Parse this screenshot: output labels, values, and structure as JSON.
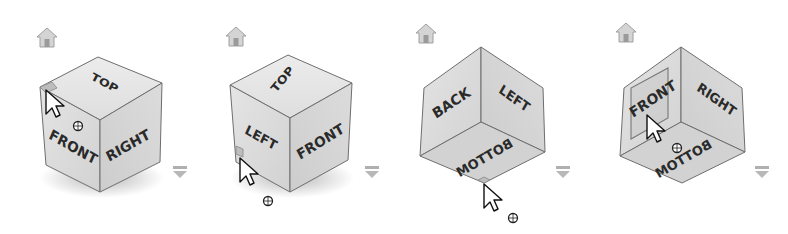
{
  "panels": [
    {
      "id": "viewcube-1",
      "faces": {
        "top": "TOP",
        "front": "FRONT",
        "right": "RIGHT"
      },
      "highlighted": "top-front-left-corner",
      "home_icon": "home-icon",
      "menu_icon": "chevron-down-icon"
    },
    {
      "id": "viewcube-2",
      "faces": {
        "top": "TOP",
        "left": "LEFT",
        "front": "FRONT"
      },
      "highlighted": "bottom-left-corner",
      "home_icon": "home-icon",
      "menu_icon": "chevron-down-icon"
    },
    {
      "id": "viewcube-3",
      "faces": {
        "back": "BACK",
        "left": "LEFT",
        "bottom": "BOTTOM"
      },
      "highlighted": "bottom-corner",
      "home_icon": "home-icon",
      "menu_icon": "chevron-down-icon"
    },
    {
      "id": "viewcube-4",
      "faces": {
        "front": "FRONT",
        "right": "RIGHT",
        "bottom": "BOTTOM"
      },
      "highlighted": "front-face",
      "home_icon": "home-icon",
      "menu_icon": "chevron-down-icon"
    }
  ],
  "colors": {
    "face_light": "#e6e6e6",
    "face_mid": "#d6d6d6",
    "face_dark": "#c8c8c8",
    "edge": "#6e6e6e",
    "label": "#2a2a2a",
    "icon": "#a8a8a8",
    "highlight": "#bcbcbc"
  }
}
